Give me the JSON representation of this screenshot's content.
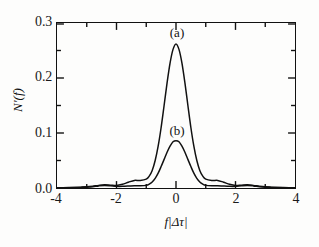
{
  "chart_data": {
    "type": "line",
    "title": "",
    "xlabel": "f|Δτ|",
    "ylabel": "N′(f)",
    "xlim": [
      -4,
      4
    ],
    "ylim": [
      0.0,
      0.3
    ],
    "xticks": [
      "-4",
      "-2",
      "0",
      "2",
      "4"
    ],
    "xtick_values": [
      -4,
      -2,
      0,
      2,
      4
    ],
    "yticks": [
      "0.0",
      "0.1",
      "0.2",
      "0.3"
    ],
    "ytick_values": [
      0.0,
      0.1,
      0.2,
      0.3
    ],
    "grid": false,
    "legend_position": "inline-annotations",
    "minor_ticks": true,
    "annotations": [
      {
        "text": "(a)",
        "x": 0.0,
        "y": 0.295,
        "series": "a"
      },
      {
        "text": "(b)",
        "x": 0.0,
        "y": 0.118,
        "series": "b"
      }
    ],
    "series": [
      {
        "name": "(a)",
        "color": "#111111",
        "peak_x": 0.0,
        "peak_y": 0.262,
        "x": [
          -4.0,
          -3.8,
          -3.6,
          -3.4,
          -3.2,
          -3.0,
          -2.8,
          -2.6,
          -2.4,
          -2.2,
          -2.0,
          -1.8,
          -1.6,
          -1.4,
          -1.2,
          -1.0,
          -0.9,
          -0.8,
          -0.7,
          -0.6,
          -0.5,
          -0.4,
          -0.3,
          -0.2,
          -0.1,
          0.0,
          0.1,
          0.2,
          0.3,
          0.4,
          0.5,
          0.6,
          0.7,
          0.8,
          0.9,
          1.0,
          1.2,
          1.4,
          1.6,
          1.8,
          2.0,
          2.2,
          2.4,
          2.6,
          2.8,
          3.0,
          3.2,
          3.4,
          3.6,
          3.8,
          4.0
        ],
        "y": [
          0.0005,
          0.0006,
          0.0008,
          0.0011,
          0.0016,
          0.0022,
          0.0033,
          0.0048,
          0.0058,
          0.0052,
          0.0046,
          0.0068,
          0.0105,
          0.0138,
          0.0135,
          0.016,
          0.0215,
          0.032,
          0.05,
          0.076,
          0.11,
          0.15,
          0.191,
          0.227,
          0.252,
          0.262,
          0.252,
          0.227,
          0.191,
          0.15,
          0.11,
          0.076,
          0.05,
          0.032,
          0.0215,
          0.016,
          0.0135,
          0.0138,
          0.0105,
          0.0068,
          0.0046,
          0.0052,
          0.0058,
          0.0048,
          0.0033,
          0.0022,
          0.0016,
          0.0011,
          0.0008,
          0.0006,
          0.0005
        ]
      },
      {
        "name": "(b)",
        "color": "#111111",
        "peak_x": 0.0,
        "peak_y": 0.086,
        "x": [
          -4.0,
          -3.8,
          -3.6,
          -3.4,
          -3.2,
          -3.0,
          -2.8,
          -2.6,
          -2.4,
          -2.2,
          -2.0,
          -1.8,
          -1.6,
          -1.4,
          -1.2,
          -1.0,
          -0.9,
          -0.8,
          -0.7,
          -0.6,
          -0.5,
          -0.4,
          -0.3,
          -0.2,
          -0.1,
          0.0,
          0.1,
          0.2,
          0.3,
          0.4,
          0.5,
          0.6,
          0.7,
          0.8,
          0.9,
          1.0,
          1.2,
          1.4,
          1.6,
          1.8,
          2.0,
          2.2,
          2.4,
          2.6,
          2.8,
          3.0,
          3.2,
          3.4,
          3.6,
          3.8,
          4.0
        ],
        "y": [
          0.0004,
          0.0005,
          0.0006,
          0.0008,
          0.0011,
          0.0015,
          0.0024,
          0.0038,
          0.0046,
          0.004,
          0.003,
          0.003,
          0.0035,
          0.0042,
          0.004,
          0.0048,
          0.007,
          0.011,
          0.0175,
          0.027,
          0.039,
          0.052,
          0.065,
          0.076,
          0.084,
          0.086,
          0.084,
          0.076,
          0.065,
          0.052,
          0.039,
          0.027,
          0.0175,
          0.011,
          0.007,
          0.0048,
          0.004,
          0.0042,
          0.0035,
          0.003,
          0.003,
          0.004,
          0.0046,
          0.0038,
          0.0024,
          0.0015,
          0.0011,
          0.0008,
          0.0006,
          0.0005,
          0.0004
        ]
      }
    ]
  },
  "figure": {
    "background": "#fdfdfc",
    "axis_color": "#111111",
    "curve_color": "#111111"
  }
}
